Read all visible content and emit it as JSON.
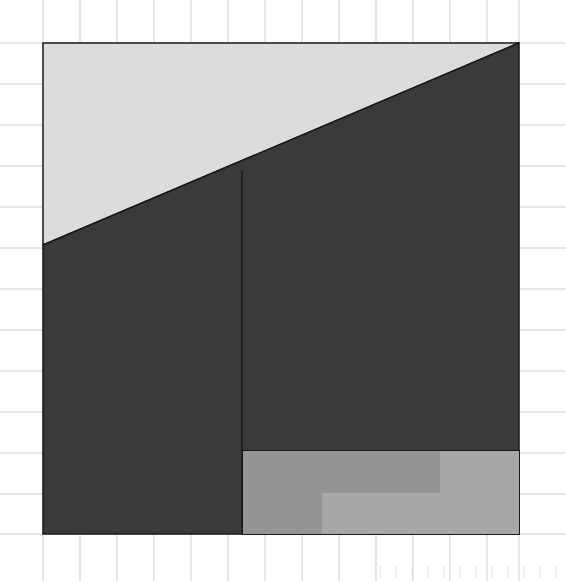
{
  "figure": {
    "title": "",
    "width": 566,
    "height": 581,
    "background_color": "#ffffff",
    "grid": {
      "visible": true,
      "line_color": "#cfcfcf",
      "minor_tick_color": "#e2e2e2",
      "line_width": 1,
      "vertical_lines_x": [
        43,
        80,
        117,
        154,
        191,
        228,
        265,
        302,
        339,
        376,
        413,
        450,
        487,
        519
      ],
      "horizontal_lines_y": [
        43,
        84,
        125,
        166,
        207,
        248,
        289,
        330,
        371,
        412,
        453,
        494,
        534
      ],
      "bottom_minor_ticks_x": [
        380,
        396,
        412,
        428,
        444,
        460,
        476,
        492,
        508,
        524,
        540,
        556
      ],
      "bottom_minor_tick_top_y": 566,
      "bottom_minor_tick_bottom_y": 578
    },
    "bounds": {
      "left": 43,
      "top": 43,
      "right": 519,
      "bottom": 534
    },
    "colors": {
      "light_fill": "#dcdcdc",
      "dark_fill": "#3a3a3a",
      "mid_gray_fill": "#959595",
      "light_gray_fill": "#a8a8a8",
      "outline": "#1a1a1a"
    },
    "shapes": [
      {
        "name": "upper-light-triangle",
        "type": "polygon",
        "fill": "#dcdcdc",
        "stroke": "#1a1a1a",
        "stroke_width": 1.5,
        "points": "43,43 519,43 43,245"
      },
      {
        "name": "dark-body-region",
        "type": "polygon",
        "fill": "#3a3a3a",
        "stroke": "#1a1a1a",
        "stroke_width": 1.5,
        "points": "43,245 519,43 519,534 43,534"
      },
      {
        "name": "vertical-divider-line",
        "type": "line",
        "stroke": "#1a1a1a",
        "stroke_width": 1.5,
        "x1": 242,
        "y1": 170,
        "x2": 242,
        "y2": 534
      },
      {
        "name": "z-step-polygon",
        "type": "polygon",
        "fill": "#9c9c9c",
        "stroke": "#1a1a1a",
        "stroke_width": 2,
        "points": "243,451 519,451 519,534 243,534"
      },
      {
        "name": "z-step-inner-notch",
        "type": "polyline",
        "stroke": "#1a1a1a",
        "stroke_width": 2.5,
        "points": "440,451 440,493 322,493 322,534"
      },
      {
        "name": "z-step-left-lobe",
        "type": "polygon",
        "fill": "#949494",
        "stroke": "none",
        "points": "243,451 440,451 440,493 322,493 322,534 243,534"
      },
      {
        "name": "z-step-right-lobe",
        "type": "polygon",
        "fill": "#a7a7a7",
        "stroke": "none",
        "points": "440,451 519,451 519,534 322,534 322,493 440,493"
      }
    ]
  }
}
